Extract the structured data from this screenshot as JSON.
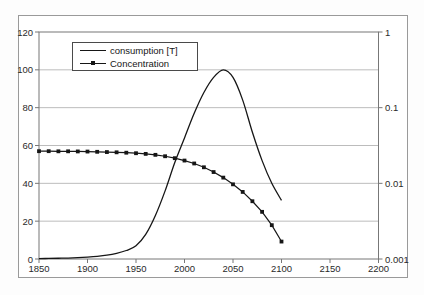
{
  "chart_data": {
    "type": "line",
    "title": "",
    "xlabel": "",
    "ylabel_left": "",
    "ylabel_right": "",
    "x": [
      1850,
      1860,
      1870,
      1880,
      1890,
      1900,
      1910,
      1920,
      1930,
      1940,
      1950,
      1960,
      1970,
      1980,
      1990,
      2000,
      2010,
      2020,
      2030,
      2040,
      2050,
      2060,
      2070,
      2080,
      2090,
      2100
    ],
    "series": [
      {
        "name": "consumption [T]",
        "axis": "left",
        "marker": "none",
        "color": "#161616",
        "values": [
          0.2,
          0.3,
          0.4,
          0.5,
          0.7,
          1,
          1.4,
          2,
          3,
          4.5,
          7,
          13,
          23,
          36,
          51,
          64,
          77,
          88,
          96,
          100,
          96,
          84,
          67,
          52,
          40,
          31
        ]
      },
      {
        "name": "Concentration",
        "axis": "right",
        "marker": "square",
        "color": "#161616",
        "values": [
          0.0266,
          0.0266,
          0.0265,
          0.0265,
          0.0264,
          0.0263,
          0.0261,
          0.0259,
          0.0257,
          0.0254,
          0.025,
          0.0245,
          0.0238,
          0.0228,
          0.0215,
          0.02,
          0.0183,
          0.0163,
          0.0141,
          0.0119,
          0.0097,
          0.0077,
          0.0058,
          0.0042,
          0.0028,
          0.0017
        ]
      }
    ],
    "x_axis": {
      "range": [
        1850,
        2200
      ],
      "ticks": [
        1850,
        1900,
        1950,
        2000,
        2050,
        2100,
        2150,
        2200
      ],
      "tick_labels": [
        "1850",
        "1900",
        "1950",
        "2000",
        "2050",
        "2100",
        "2150",
        "2200"
      ]
    },
    "y_axis_left": {
      "scale": "linear",
      "range": [
        0,
        120
      ],
      "ticks": [
        0,
        20,
        40,
        60,
        80,
        100,
        120
      ],
      "tick_labels": [
        "0",
        "20",
        "40",
        "60",
        "80",
        "100",
        "120"
      ],
      "gridlines": [
        20,
        40,
        60,
        80,
        100
      ]
    },
    "y_axis_right": {
      "scale": "log",
      "range": [
        0.001,
        1
      ],
      "ticks": [
        1,
        0.1,
        0.01,
        0.001
      ],
      "tick_labels": [
        "1",
        "0.1",
        "0.01",
        "0.001"
      ]
    },
    "legend": {
      "position": "top-left",
      "entries": [
        "consumption [T]",
        "Concentration"
      ]
    }
  },
  "colors": {
    "background": "#ffffff",
    "frame_border": "#9a9a9a",
    "plot_border": "#777777",
    "gridline": "#bcbcbc",
    "series": "#161616",
    "text": "#2a2a2a"
  }
}
